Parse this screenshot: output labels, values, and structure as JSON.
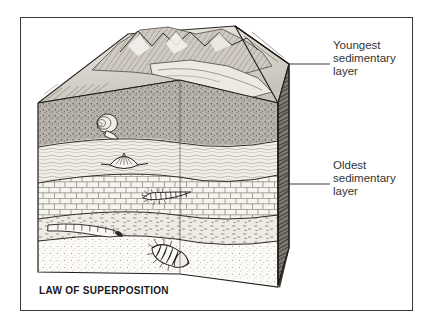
{
  "figure": {
    "caption": "LAW OF SUPERPOSITION",
    "frame_color": "#3a3a3a",
    "background": "#ffffff",
    "ink_color": "#1a1a1a"
  },
  "annotations": [
    {
      "id": "youngest",
      "text": "Youngest\nsedimentary\nlayer",
      "leader_y": 64
    },
    {
      "id": "oldest",
      "text": "Oldest\nsedimentary\nlayer",
      "leader_y": 184
    }
  ],
  "block_diagram": {
    "type": "geologic-block-diagram",
    "surface": "mountainous eroded terrain with valley",
    "layers": [
      {
        "order": 1,
        "name": "Youngest sedimentary layer",
        "pattern": "dark stippled siltstone",
        "fossil": "gastropod snail shell"
      },
      {
        "order": 2,
        "name": "Shale layer",
        "pattern": "wavy laminated shale",
        "fossil": "brachiopod scallop shell"
      },
      {
        "order": 3,
        "name": "Limestone layer",
        "pattern": "brick / blocky limestone",
        "fossil": "segmented arthropod centipede"
      },
      {
        "order": 4,
        "name": "Mudstone layer",
        "pattern": "dashed mudstone",
        "fossil": "segmented worm / crinoid stem"
      },
      {
        "order": 5,
        "name": "Oldest sedimentary layer",
        "pattern": "stippled sandstone",
        "fossil": "trilobite"
      }
    ]
  }
}
